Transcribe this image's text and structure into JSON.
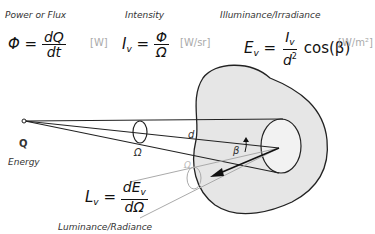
{
  "labels": {
    "power": "Power or Flux",
    "intensity": "Intensity",
    "illuminance": "Illuminance/Irradiance",
    "energy": "Energy",
    "luminance": "Luminance/Radiance",
    "q_point": "Q",
    "omega": "Ω",
    "omega_small": "Ω",
    "d": "d",
    "beta": "β"
  },
  "equations": {
    "flux": {
      "lhs": "Φ",
      "eq": "=",
      "num": "dQ",
      "den": "dt",
      "unit": "[W]"
    },
    "intensity": {
      "lhs": "I",
      "lhs_sub": "v",
      "eq": "=",
      "num": "Φ",
      "den": "Ω",
      "unit": "[W/sr]"
    },
    "illuminance": {
      "lhs": "E",
      "lhs_sub": "v",
      "eq": "=",
      "num": "I",
      "num_sub": "v",
      "den": "d",
      "den_sup": "2",
      "tail": "cos(β)",
      "unit": "[W/m²]"
    },
    "luminance": {
      "lhs": "L",
      "lhs_sub": "v",
      "eq": "=",
      "num": "dE",
      "num_sub": "v",
      "den": "dΩ"
    }
  },
  "colors": {
    "surface_fill": "#e6e6e6",
    "line": "#222222",
    "light_line": "#aaaaaa"
  }
}
